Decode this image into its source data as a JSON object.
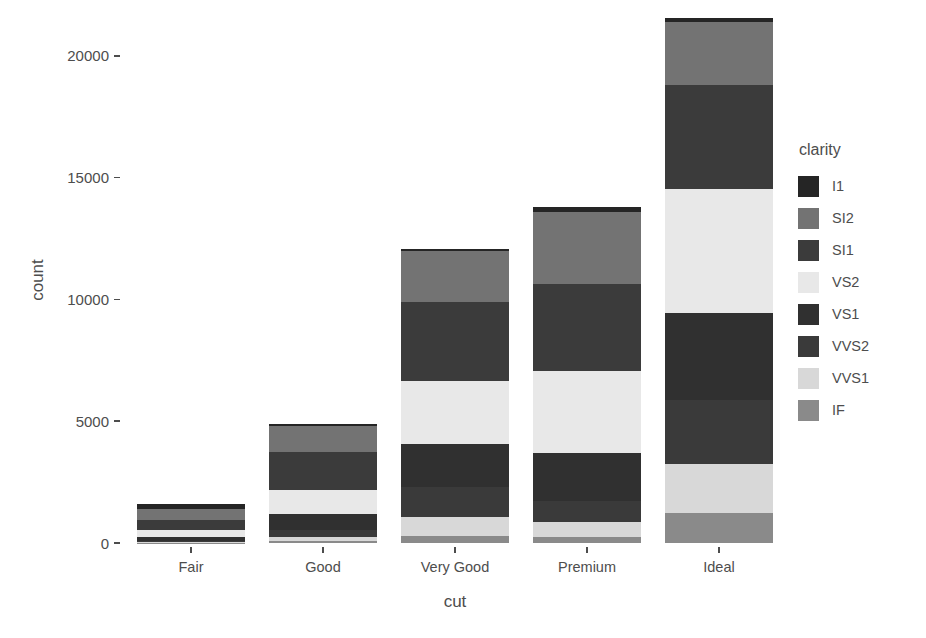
{
  "chart_data": {
    "type": "bar",
    "stacked": true,
    "title": "",
    "subtitle": "",
    "xlabel": "cut",
    "ylabel": "count",
    "categories": [
      "Fair",
      "Good",
      "Very Good",
      "Premium",
      "Ideal"
    ],
    "legend_title": "clarity",
    "legend_position": "right",
    "grid": false,
    "ylim": [
      0,
      21551
    ],
    "yticks": [
      0,
      5000,
      10000,
      15000,
      20000
    ],
    "ytick_labels": [
      "0",
      "5000",
      "10000",
      "15000",
      "20000"
    ],
    "stack_order_top_to_bottom": [
      "I1",
      "SI2",
      "SI1",
      "VS2",
      "VS1",
      "VVS2",
      "VVS1",
      "IF"
    ],
    "series": [
      {
        "name": "I1",
        "color": "#252525",
        "values": [
          210,
          96,
          84,
          205,
          146
        ]
      },
      {
        "name": "SI2",
        "color": "#737373",
        "values": [
          466,
          1081,
          2100,
          2949,
          2598
        ]
      },
      {
        "name": "SI1",
        "color": "#3b3b3b",
        "values": [
          408,
          1560,
          3240,
          3575,
          4282
        ]
      },
      {
        "name": "VS2",
        "color": "#e8e8e8",
        "values": [
          261,
          978,
          2591,
          3357,
          5071
        ]
      },
      {
        "name": "VS1",
        "color": "#303030",
        "values": [
          170,
          648,
          1775,
          1989,
          3589
        ]
      },
      {
        "name": "VVS2",
        "color": "#3a3a3a",
        "values": [
          69,
          286,
          1235,
          870,
          2606
        ]
      },
      {
        "name": "VVS1",
        "color": "#d8d8d8",
        "values": [
          17,
          186,
          789,
          616,
          2047
        ]
      },
      {
        "name": "IF",
        "color": "#8a8a8a",
        "values": [
          9,
          71,
          268,
          230,
          1212
        ]
      }
    ],
    "totals": [
      1610,
      4906,
      12082,
      13791,
      21551
    ],
    "annotations": []
  },
  "axes": {
    "y": {
      "title": "count"
    },
    "x": {
      "title": "cut"
    }
  },
  "legend": {
    "title": "clarity",
    "items": [
      {
        "label": "I1",
        "color": "#252525"
      },
      {
        "label": "SI2",
        "color": "#737373"
      },
      {
        "label": "SI1",
        "color": "#3b3b3b"
      },
      {
        "label": "VS2",
        "color": "#e8e8e8"
      },
      {
        "label": "VS1",
        "color": "#303030"
      },
      {
        "label": "VVS2",
        "color": "#3a3a3a"
      },
      {
        "label": "VVS1",
        "color": "#d8d8d8"
      },
      {
        "label": "IF",
        "color": "#8a8a8a"
      }
    ]
  },
  "theme": {
    "background": "#ffffff",
    "text_color": "#4d4d4d"
  }
}
